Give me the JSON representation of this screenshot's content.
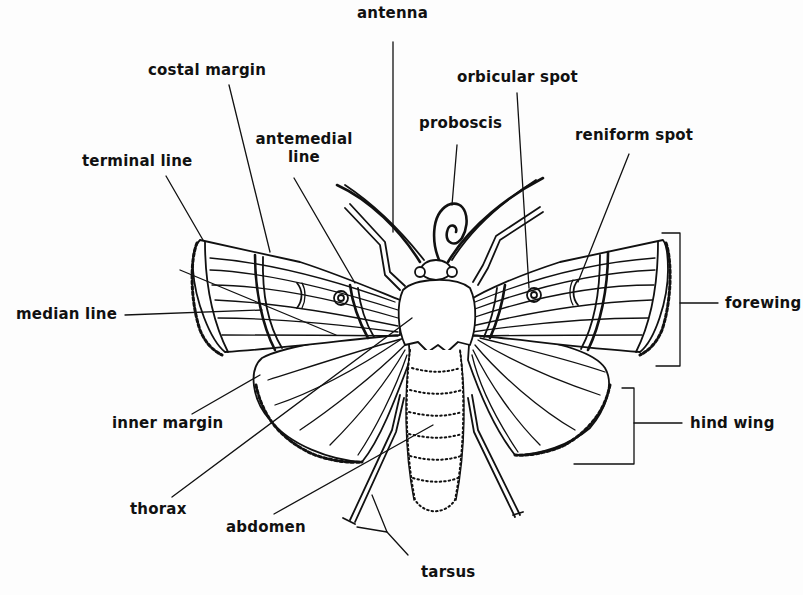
{
  "diagram": {
    "colors": {
      "ink": "#111111",
      "background": "#ffffff"
    },
    "labels": {
      "antenna": "antenna",
      "costal_margin": "costal margin",
      "orbicular_spot": "orbicular spot",
      "proboscis": "proboscis",
      "reniform_spot": "reniform spot",
      "antemedial_line_1": "antemedial",
      "antemedial_line_2": "line",
      "terminal_line": "terminal line",
      "median_line": "median line",
      "forewing": "forewing",
      "inner_margin": "inner margin",
      "hind_wing": "hind wing",
      "thorax": "thorax",
      "abdomen": "abdomen",
      "tarsus": "tarsus"
    }
  }
}
